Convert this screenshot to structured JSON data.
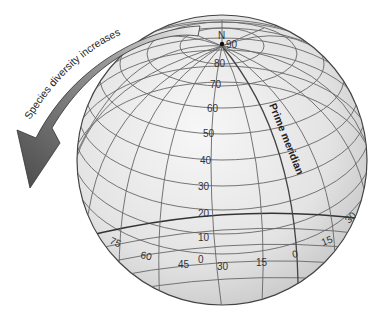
{
  "diagram": {
    "arrow_label": "Species diversity increases",
    "pole_label": "N",
    "prime_meridian_label": "Prime meridian",
    "latitude_labels": [
      "90",
      "80",
      "70",
      "60",
      "50",
      "40",
      "30",
      "20",
      "10",
      "0"
    ],
    "longitude_labels": [
      "75",
      "60",
      "45",
      "30",
      "15",
      "0",
      "15",
      "30"
    ],
    "colors": {
      "globe_fill": "#e6e6e6",
      "grid_line": "#666666",
      "arrow_dark": "#555555",
      "arrow_light": "#eeeeee"
    }
  }
}
